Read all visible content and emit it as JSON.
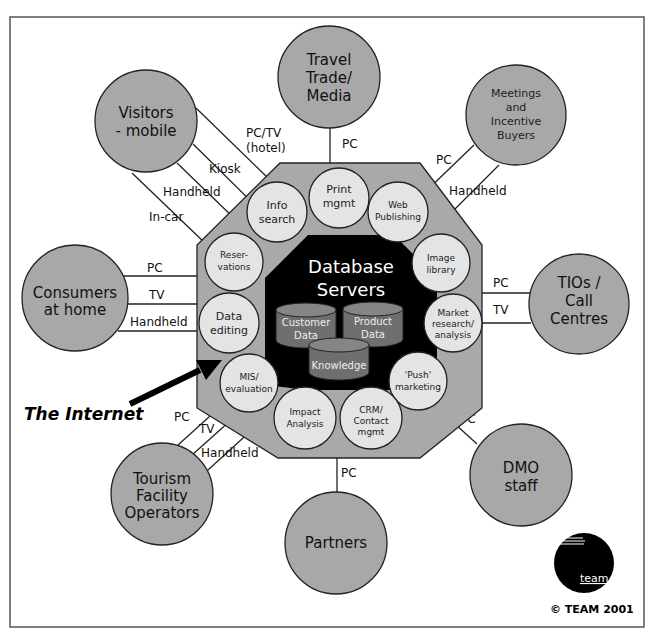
{
  "diagram": {
    "center": {
      "title_lines": [
        "Database",
        "Servers"
      ],
      "databases": [
        {
          "id": "customer",
          "lines": [
            "Customer",
            "Data"
          ]
        },
        {
          "id": "product",
          "lines": [
            "Product",
            "Data"
          ]
        },
        {
          "id": "knowledge",
          "lines": [
            "Knowledge"
          ]
        }
      ]
    },
    "functions": [
      {
        "id": "print-mgmt",
        "lines": [
          "Print",
          "mgmt"
        ]
      },
      {
        "id": "web-publishing",
        "lines": [
          "Web",
          "Publishing"
        ]
      },
      {
        "id": "image-library",
        "lines": [
          "Image",
          "library"
        ]
      },
      {
        "id": "market-research",
        "lines": [
          "Market",
          "research/",
          "analysis"
        ]
      },
      {
        "id": "push-marketing",
        "lines": [
          "'Push'",
          "marketing"
        ]
      },
      {
        "id": "crm",
        "lines": [
          "CRM/",
          "Contact",
          "mgmt"
        ]
      },
      {
        "id": "impact-analysis",
        "lines": [
          "Impact",
          "Analysis"
        ]
      },
      {
        "id": "mis-evaluation",
        "lines": [
          "MIS/",
          "evaluation"
        ]
      },
      {
        "id": "data-editing",
        "lines": [
          "Data",
          "editing"
        ]
      },
      {
        "id": "reservations",
        "lines": [
          "Reser-",
          "vations"
        ]
      },
      {
        "id": "info-search",
        "lines": [
          "Info",
          "search"
        ]
      }
    ],
    "stakeholders": [
      {
        "id": "visitors-mobile",
        "lines": [
          "Visitors",
          "- mobile"
        ],
        "channels": [
          "PC/TV (hotel)",
          "Kiosk",
          "Handheld",
          "In-car"
        ]
      },
      {
        "id": "travel-trade",
        "lines": [
          "Travel",
          "Trade/",
          "Media"
        ],
        "channels": [
          "PC"
        ]
      },
      {
        "id": "meetings-buyers",
        "lines": [
          "Meetings",
          "and",
          "Incentive",
          "Buyers"
        ],
        "channels": [
          "PC",
          "Handheld"
        ]
      },
      {
        "id": "consumers-home",
        "lines": [
          "Consumers",
          "at home"
        ],
        "channels": [
          "PC",
          "TV",
          "Handheld"
        ]
      },
      {
        "id": "tios-call-centres",
        "lines": [
          "TIOs /",
          "Call",
          "Centres"
        ],
        "channels": [
          "PC",
          "TV"
        ]
      },
      {
        "id": "dmo-staff",
        "lines": [
          "DMO",
          "staff"
        ],
        "channels": [
          "PC"
        ]
      },
      {
        "id": "tourism-operators",
        "lines": [
          "Tourism",
          "Facility",
          "Operators"
        ],
        "channels": [
          "PC",
          "TV",
          "Handheld"
        ]
      },
      {
        "id": "partners",
        "lines": [
          "Partners"
        ],
        "channels": [
          "PC"
        ]
      }
    ],
    "channel_labels": {
      "pc_tv_hotel_1": "PC/TV",
      "pc_tv_hotel_2": "(hotel)",
      "kiosk": "Kiosk",
      "handheld": "Handheld",
      "in_car": "In-car",
      "pc": "PC",
      "tv": "TV"
    },
    "annotation": "The Internet",
    "logo_text": "team",
    "copyright": "© TEAM 2001"
  },
  "colors": {
    "stakeholder_fill": "#a8a8a8",
    "octagon_fill": "#a9a9a9",
    "function_fill": "#e4e4e4",
    "core_fill": "#000000",
    "database_fill": "#6f6f6f"
  }
}
